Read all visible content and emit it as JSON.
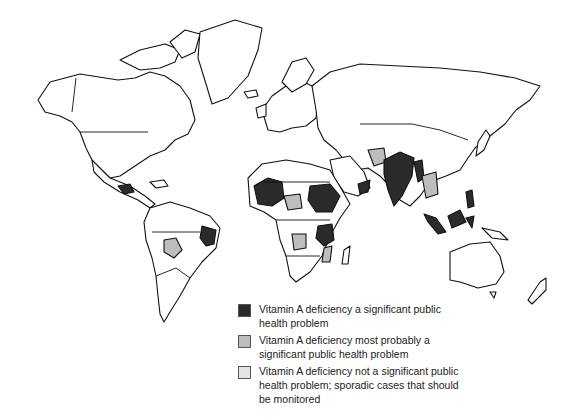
{
  "colors": {
    "significant": "#2b2b2b",
    "most_probably_significant": "#bdbdbd",
    "not_significant": "#e4e4e4",
    "land": "#ffffff",
    "outline": "#111111"
  },
  "legend": {
    "items": [
      {
        "label": "Vitamin A deficiency a significant public health problem",
        "color": "#2b2b2b"
      },
      {
        "label": "Vitamin A deficiency most probably a significant public health problem",
        "color": "#bdbdbd"
      },
      {
        "label": "Vitamin A deficiency not a significant public health problem; sporadic cases that should be monitored",
        "color": "#e4e4e4"
      }
    ]
  },
  "regions": {
    "significant": [
      "Mali/West Sahel",
      "Sudan",
      "Tanzania",
      "India",
      "Bangladesh",
      "Myanmar",
      "Indonesia",
      "Philippines",
      "Yemen",
      "Northeast Brazil",
      "Central America"
    ],
    "most_probably_significant": [
      "Bolivia",
      "Central Africa",
      "Angola",
      "Mozambique",
      "Pakistan",
      "Thailand",
      "Vietnam"
    ],
    "not_significant": [
      "China",
      "North Africa",
      "Middle East"
    ]
  }
}
